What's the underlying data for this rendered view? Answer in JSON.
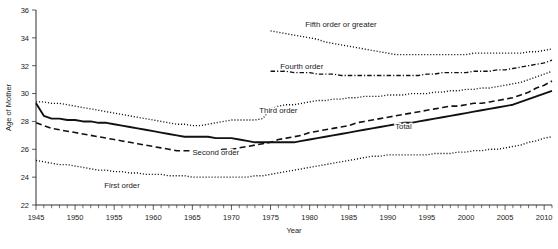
{
  "chart_data": {
    "type": "line",
    "title": "",
    "xlabel": "Year",
    "ylabel": "Age of Mother",
    "xlim": [
      1945,
      2011
    ],
    "ylim": [
      22,
      36
    ],
    "yticks": [
      22,
      24,
      26,
      28,
      30,
      32,
      34,
      36
    ],
    "xticks": [
      1945,
      1950,
      1955,
      1960,
      1965,
      1970,
      1975,
      1980,
      1985,
      1990,
      1995,
      2000,
      2005,
      2010
    ],
    "minor_tick_step": 1,
    "grid": false,
    "legend": "inline-annotations",
    "series": [
      {
        "name": "Total",
        "label": "Total",
        "style": "solid",
        "label_x": 1992,
        "label_y": 27.45,
        "x": [
          1945,
          1946,
          1947,
          1948,
          1949,
          1950,
          1951,
          1952,
          1953,
          1954,
          1955,
          1956,
          1957,
          1958,
          1959,
          1960,
          1961,
          1962,
          1963,
          1964,
          1965,
          1966,
          1967,
          1968,
          1969,
          1970,
          1971,
          1972,
          1973,
          1974,
          1975,
          1976,
          1977,
          1978,
          1979,
          1980,
          1981,
          1982,
          1983,
          1984,
          1985,
          1986,
          1987,
          1988,
          1989,
          1990,
          1991,
          1992,
          1993,
          1994,
          1995,
          1996,
          1997,
          1998,
          1999,
          2000,
          2001,
          2002,
          2003,
          2004,
          2005,
          2006,
          2007,
          2008,
          2009,
          2010,
          2011
        ],
        "y": [
          29.3,
          28.4,
          28.2,
          28.2,
          28.1,
          28.1,
          28.0,
          28.0,
          27.9,
          27.9,
          27.8,
          27.7,
          27.6,
          27.5,
          27.4,
          27.3,
          27.2,
          27.1,
          27.0,
          26.9,
          26.9,
          26.9,
          26.9,
          26.8,
          26.8,
          26.8,
          26.7,
          26.6,
          26.5,
          26.5,
          26.5,
          26.5,
          26.5,
          26.5,
          26.6,
          26.7,
          26.8,
          26.9,
          27.0,
          27.1,
          27.2,
          27.3,
          27.4,
          27.5,
          27.6,
          27.7,
          27.8,
          27.9,
          27.9,
          28.0,
          28.1,
          28.2,
          28.3,
          28.4,
          28.5,
          28.6,
          28.7,
          28.8,
          28.9,
          29.0,
          29.1,
          29.2,
          29.4,
          29.6,
          29.8,
          30.0,
          30.2
        ]
      },
      {
        "name": "First order",
        "label": "First order",
        "style": "dotted",
        "label_x": 1956,
        "label_y": 23.2,
        "x": [
          1945,
          1946,
          1947,
          1948,
          1949,
          1950,
          1951,
          1952,
          1953,
          1954,
          1955,
          1956,
          1957,
          1958,
          1959,
          1960,
          1961,
          1962,
          1963,
          1964,
          1965,
          1966,
          1967,
          1968,
          1969,
          1970,
          1971,
          1972,
          1973,
          1974,
          1975,
          1976,
          1977,
          1978,
          1979,
          1980,
          1981,
          1982,
          1983,
          1984,
          1985,
          1986,
          1987,
          1988,
          1989,
          1990,
          1991,
          1992,
          1993,
          1994,
          1995,
          1996,
          1997,
          1998,
          1999,
          2000,
          2001,
          2002,
          2003,
          2004,
          2005,
          2006,
          2007,
          2008,
          2009,
          2010,
          2011
        ],
        "y": [
          25.2,
          25.1,
          25.0,
          24.9,
          24.9,
          24.8,
          24.7,
          24.6,
          24.5,
          24.5,
          24.4,
          24.4,
          24.3,
          24.3,
          24.2,
          24.2,
          24.2,
          24.1,
          24.1,
          24.1,
          24.0,
          24.0,
          24.0,
          24.0,
          24.0,
          24.0,
          24.0,
          24.0,
          24.1,
          24.1,
          24.2,
          24.3,
          24.4,
          24.5,
          24.6,
          24.7,
          24.8,
          24.9,
          25.0,
          25.1,
          25.2,
          25.3,
          25.4,
          25.5,
          25.5,
          25.6,
          25.6,
          25.6,
          25.6,
          25.6,
          25.6,
          25.7,
          25.7,
          25.7,
          25.8,
          25.8,
          25.9,
          25.9,
          26.0,
          26.0,
          26.1,
          26.2,
          26.3,
          26.5,
          26.6,
          26.8,
          26.9
        ]
      },
      {
        "name": "Second order",
        "label": "Second order",
        "style": "dashed",
        "label_x": 1968,
        "label_y": 25.6,
        "x": [
          1945,
          1946,
          1947,
          1948,
          1949,
          1950,
          1951,
          1952,
          1953,
          1954,
          1955,
          1956,
          1957,
          1958,
          1959,
          1960,
          1961,
          1962,
          1963,
          1964,
          1965,
          1966,
          1967,
          1968,
          1969,
          1970,
          1971,
          1972,
          1973,
          1974,
          1975,
          1976,
          1977,
          1978,
          1979,
          1980,
          1981,
          1982,
          1983,
          1984,
          1985,
          1986,
          1987,
          1988,
          1989,
          1990,
          1991,
          1992,
          1993,
          1994,
          1995,
          1996,
          1997,
          1998,
          1999,
          2000,
          2001,
          2002,
          2003,
          2004,
          2005,
          2006,
          2007,
          2008,
          2009,
          2010,
          2011
        ],
        "y": [
          27.9,
          27.7,
          27.5,
          27.4,
          27.3,
          27.2,
          27.1,
          27.0,
          26.9,
          26.8,
          26.7,
          26.6,
          26.5,
          26.4,
          26.3,
          26.2,
          26.1,
          26.0,
          25.9,
          25.9,
          25.9,
          25.9,
          25.9,
          25.9,
          26.0,
          26.0,
          26.1,
          26.2,
          26.3,
          26.4,
          26.5,
          26.7,
          26.8,
          26.9,
          27.0,
          27.2,
          27.3,
          27.4,
          27.5,
          27.6,
          27.7,
          27.9,
          28.0,
          28.1,
          28.2,
          28.3,
          28.4,
          28.5,
          28.6,
          28.7,
          28.8,
          28.9,
          29.0,
          29.1,
          29.1,
          29.2,
          29.3,
          29.3,
          29.4,
          29.5,
          29.6,
          29.7,
          29.9,
          30.1,
          30.4,
          30.6,
          30.9
        ]
      },
      {
        "name": "Third order",
        "label": "Third order",
        "style": "dotted",
        "label_x": 1976,
        "label_y": 28.6,
        "x": [
          1945,
          1946,
          1947,
          1948,
          1949,
          1950,
          1951,
          1952,
          1953,
          1954,
          1955,
          1956,
          1957,
          1958,
          1959,
          1960,
          1961,
          1962,
          1963,
          1964,
          1965,
          1966,
          1967,
          1968,
          1969,
          1970,
          1971,
          1972,
          1973,
          1974,
          1975,
          1976,
          1977,
          1978,
          1979,
          1980,
          1981,
          1982,
          1983,
          1984,
          1985,
          1986,
          1987,
          1988,
          1989,
          1990,
          1991,
          1992,
          1993,
          1994,
          1995,
          1996,
          1997,
          1998,
          1999,
          2000,
          2001,
          2002,
          2003,
          2004,
          2005,
          2006,
          2007,
          2008,
          2009,
          2010,
          2011
        ],
        "y": [
          29.4,
          29.4,
          29.3,
          29.3,
          29.2,
          29.1,
          29.0,
          28.9,
          28.8,
          28.7,
          28.6,
          28.5,
          28.4,
          28.3,
          28.2,
          28.1,
          28.0,
          27.9,
          27.8,
          27.8,
          27.7,
          27.7,
          27.8,
          27.9,
          28.0,
          28.1,
          28.1,
          28.1,
          28.1,
          28.2,
          28.9,
          29.1,
          29.2,
          29.2,
          29.3,
          29.4,
          29.5,
          29.5,
          29.6,
          29.6,
          29.7,
          29.7,
          29.8,
          29.8,
          29.8,
          29.9,
          29.9,
          29.9,
          30.0,
          30.0,
          30.0,
          30.1,
          30.1,
          30.2,
          30.2,
          30.3,
          30.3,
          30.4,
          30.4,
          30.5,
          30.6,
          30.7,
          30.8,
          31.0,
          31.2,
          31.4,
          31.6
        ]
      },
      {
        "name": "Fourth order",
        "label": "Fourth order",
        "style": "dash-dot",
        "label_x": 1979,
        "label_y": 31.8,
        "x": [
          1975,
          1976,
          1977,
          1978,
          1979,
          1980,
          1981,
          1982,
          1983,
          1984,
          1985,
          1986,
          1987,
          1988,
          1989,
          1990,
          1991,
          1992,
          1993,
          1994,
          1995,
          1996,
          1997,
          1998,
          1999,
          2000,
          2001,
          2002,
          2003,
          2004,
          2005,
          2006,
          2007,
          2008,
          2009,
          2010,
          2011
        ],
        "y": [
          31.6,
          31.6,
          31.6,
          31.5,
          31.5,
          31.5,
          31.4,
          31.4,
          31.4,
          31.3,
          31.3,
          31.3,
          31.3,
          31.3,
          31.3,
          31.3,
          31.3,
          31.3,
          31.3,
          31.3,
          31.4,
          31.4,
          31.5,
          31.5,
          31.5,
          31.5,
          31.6,
          31.6,
          31.6,
          31.7,
          31.7,
          31.8,
          31.9,
          32.0,
          32.1,
          32.2,
          32.4
        ]
      },
      {
        "name": "Fifth order or greater",
        "label": "Fifth order or greater",
        "style": "dotted",
        "label_x": 1984,
        "label_y": 34.8,
        "x": [
          1975,
          1976,
          1977,
          1978,
          1979,
          1980,
          1981,
          1982,
          1983,
          1984,
          1985,
          1986,
          1987,
          1988,
          1989,
          1990,
          1991,
          1992,
          1993,
          1994,
          1995,
          1996,
          1997,
          1998,
          1999,
          2000,
          2001,
          2002,
          2003,
          2004,
          2005,
          2006,
          2007,
          2008,
          2009,
          2010,
          2011
        ],
        "y": [
          34.5,
          34.4,
          34.3,
          34.2,
          34.1,
          34.0,
          33.9,
          33.7,
          33.6,
          33.5,
          33.4,
          33.3,
          33.2,
          33.1,
          33.0,
          32.9,
          32.8,
          32.8,
          32.8,
          32.8,
          32.8,
          32.8,
          32.8,
          32.8,
          32.8,
          32.8,
          32.9,
          32.9,
          32.9,
          32.9,
          32.9,
          32.9,
          32.9,
          33.0,
          33.0,
          33.1,
          33.2
        ]
      }
    ]
  },
  "colors": {
    "ink": "#111111",
    "background": "#ffffff"
  }
}
